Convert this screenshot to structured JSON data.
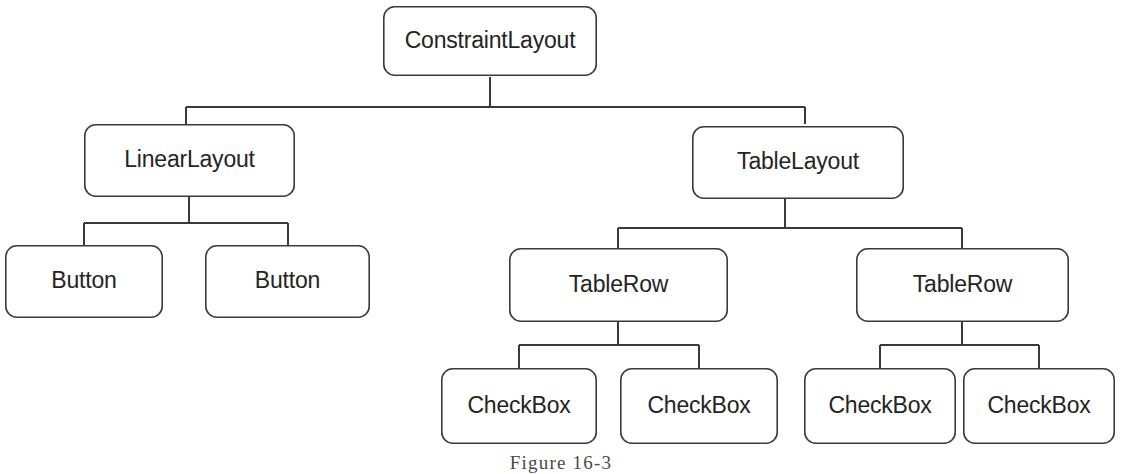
{
  "diagram": {
    "type": "tree",
    "caption": "Figure 16-3",
    "colors": {
      "background": "#ffffff",
      "stroke": "#3a3a3a",
      "node_fill": "#ffffff",
      "text": "#242424",
      "caption_text": "#4a4a4a"
    },
    "style": {
      "node_shape": "rounded-rectangle",
      "corner_radius": 11,
      "stroke_width": 1.6,
      "connector_style": "orthogonal"
    },
    "nodes": [
      {
        "id": "constraintlayout",
        "label": "ConstraintLayout",
        "level": 0,
        "x": 383,
        "y": 6,
        "w": 214,
        "h": 70
      },
      {
        "id": "linearlayout",
        "label": "LinearLayout",
        "level": 1,
        "x": 84,
        "y": 124,
        "w": 211,
        "h": 73
      },
      {
        "id": "tablelayout",
        "label": "TableLayout",
        "level": 1,
        "x": 692,
        "y": 126,
        "w": 212,
        "h": 73
      },
      {
        "id": "button-1",
        "label": "Button",
        "level": 2,
        "x": 5,
        "y": 245,
        "w": 158,
        "h": 73
      },
      {
        "id": "button-2",
        "label": "Button",
        "level": 2,
        "x": 205,
        "y": 245,
        "w": 165,
        "h": 73
      },
      {
        "id": "tablerow-1",
        "label": "TableRow",
        "level": 2,
        "x": 509,
        "y": 248,
        "w": 219,
        "h": 74
      },
      {
        "id": "tablerow-2",
        "label": "TableRow",
        "level": 2,
        "x": 856,
        "y": 248,
        "w": 213,
        "h": 74
      },
      {
        "id": "checkbox-1",
        "label": "CheckBox",
        "level": 3,
        "x": 441,
        "y": 368,
        "w": 156,
        "h": 76
      },
      {
        "id": "checkbox-2",
        "label": "CheckBox",
        "level": 3,
        "x": 620,
        "y": 368,
        "w": 158,
        "h": 76
      },
      {
        "id": "checkbox-3",
        "label": "CheckBox",
        "level": 3,
        "x": 804,
        "y": 368,
        "w": 152,
        "h": 76
      },
      {
        "id": "checkbox-4",
        "label": "CheckBox",
        "level": 3,
        "x": 963,
        "y": 368,
        "w": 152,
        "h": 76
      }
    ],
    "edges": [
      {
        "from": "constraintlayout",
        "to": "linearlayout"
      },
      {
        "from": "constraintlayout",
        "to": "tablelayout"
      },
      {
        "from": "linearlayout",
        "to": "button-1"
      },
      {
        "from": "linearlayout",
        "to": "button-2"
      },
      {
        "from": "tablelayout",
        "to": "tablerow-1"
      },
      {
        "from": "tablelayout",
        "to": "tablerow-2"
      },
      {
        "from": "tablerow-1",
        "to": "checkbox-1"
      },
      {
        "from": "tablerow-1",
        "to": "checkbox-2"
      },
      {
        "from": "tablerow-2",
        "to": "checkbox-3"
      },
      {
        "from": "tablerow-2",
        "to": "checkbox-4"
      }
    ],
    "connectors": [
      {
        "id": "root-stem",
        "from_x": 490,
        "bus_y": 107,
        "left_x": 186,
        "right_x": 805,
        "drop_to_y": 124
      },
      {
        "id": "linear-stem",
        "from_x": 189,
        "bus_y": 223,
        "left_x": 84,
        "right_x": 288,
        "drop_to_y": 245
      },
      {
        "id": "table-stem",
        "from_x": 785,
        "bus_y": 228,
        "left_x": 618,
        "right_x": 962,
        "drop_to_y": 248
      },
      {
        "id": "row1-stem",
        "from_x": 618,
        "bus_y": 345,
        "left_x": 519,
        "right_x": 699,
        "drop_to_y": 368
      },
      {
        "id": "row2-stem",
        "from_x": 962,
        "bus_y": 345,
        "left_x": 880,
        "right_x": 1039,
        "drop_to_y": 368
      }
    ]
  }
}
